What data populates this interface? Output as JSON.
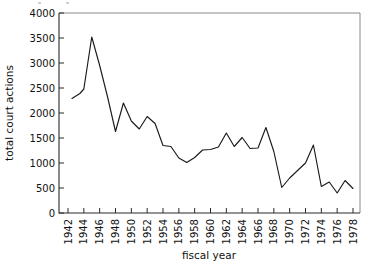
{
  "chart_data": {
    "type": "line",
    "title": "",
    "xlabel": "fiscal year",
    "ylabel": "total court actions",
    "xlim": [
      1942,
      1979
    ],
    "ylim": [
      0,
      4000
    ],
    "grid": false,
    "legend": false,
    "x_tick_labels": [
      "1942",
      "1944",
      "1946",
      "1948",
      "1950",
      "1952",
      "1954",
      "1956",
      "1958",
      "1960",
      "1962",
      "1964",
      "1966",
      "1968",
      "1970",
      "1972",
      "1974",
      "1976",
      "1978"
    ],
    "x_tick_values": [
      1942,
      1944,
      1946,
      1948,
      1950,
      1952,
      1954,
      1956,
      1958,
      1960,
      1962,
      1964,
      1966,
      1968,
      1970,
      1972,
      1974,
      1976,
      1978
    ],
    "y_tick_labels": [
      "0",
      "500",
      "1000",
      "1500",
      "2000",
      "2500",
      "3000",
      "3500",
      "4000"
    ],
    "y_tick_values": [
      0,
      500,
      1000,
      1500,
      2000,
      2500,
      3000,
      3500,
      4000
    ],
    "x": [
      1942.5,
      1943.5,
      1944,
      1945,
      1946,
      1947,
      1948,
      1949,
      1950,
      1951,
      1952,
      1953,
      1954,
      1955,
      1956,
      1957,
      1958,
      1959,
      1960,
      1961,
      1962,
      1963,
      1964,
      1965,
      1966,
      1967,
      1968,
      1969,
      1970,
      1971,
      1972,
      1973,
      1974,
      1975,
      1976,
      1977,
      1978
    ],
    "values": [
      2290,
      2390,
      2480,
      3520,
      2950,
      2320,
      1630,
      2200,
      1840,
      1680,
      1930,
      1790,
      1350,
      1330,
      1100,
      1010,
      1110,
      1260,
      1270,
      1320,
      1600,
      1330,
      1510,
      1290,
      1300,
      1710,
      1230,
      510,
      700,
      850,
      1000,
      1360,
      530,
      620,
      400,
      650,
      490
    ],
    "series_name": "total court actions"
  },
  "axes": {
    "x_title": "fiscal year",
    "y_title": "total court actions"
  }
}
